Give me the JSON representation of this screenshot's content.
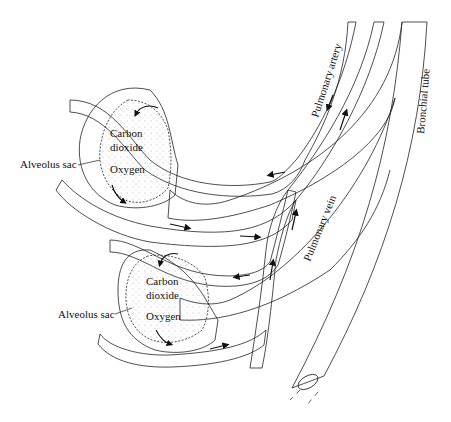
{
  "diagram": {
    "title": "",
    "colors": {
      "background": "#ffffff",
      "vein_fill": "#8a8a8a",
      "outline": "#222222",
      "stipple": "#9a9a9a"
    },
    "labels": {
      "upper_alveolus": "Alveolus sac",
      "lower_alveolus": "Alveolus sac",
      "upper_co2_line1": "Carbon",
      "upper_co2_line2": "dioxide",
      "upper_o2": "Oxygen",
      "lower_co2_line1": "Carbon",
      "lower_co2_line2": "dioxide",
      "lower_o2": "Oxygen",
      "pulmonary_artery": "Pulmonary artery",
      "pulmonary_vein": "Pulmonary vein",
      "bronchial_tube": "Bronchial tube"
    }
  }
}
